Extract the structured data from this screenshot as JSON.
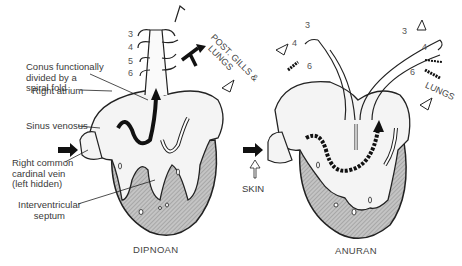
{
  "figure": {
    "panels": [
      {
        "caption": "DIPNOAN",
        "labels": {
          "conus": [
            "Conus functionally",
            "divided by a",
            "spiral fold"
          ],
          "right_atrium": "Right atrium",
          "sinus_venosus": "Sinus venosus",
          "cardinal_vein": [
            "Right common",
            "cardinal vein",
            "(left hidden)"
          ],
          "septum": [
            "Interventricular",
            "septum"
          ],
          "arches": [
            "3",
            "4",
            "5",
            "6"
          ],
          "post_gills": [
            "POST. GILLS &",
            "LUNGS"
          ]
        }
      },
      {
        "caption": "ANURAN",
        "labels": {
          "arches_left": [
            "3",
            "4",
            "6"
          ],
          "arches_right": [
            "3",
            "4",
            "6"
          ],
          "lungs": "LUNGS",
          "skin": "SKIN"
        }
      }
    ],
    "colors": {
      "outline": "#222222",
      "ventricle_fill": "#b8b8b8",
      "atrium_fill": "#f4f4f4",
      "background": "#ffffff"
    }
  }
}
